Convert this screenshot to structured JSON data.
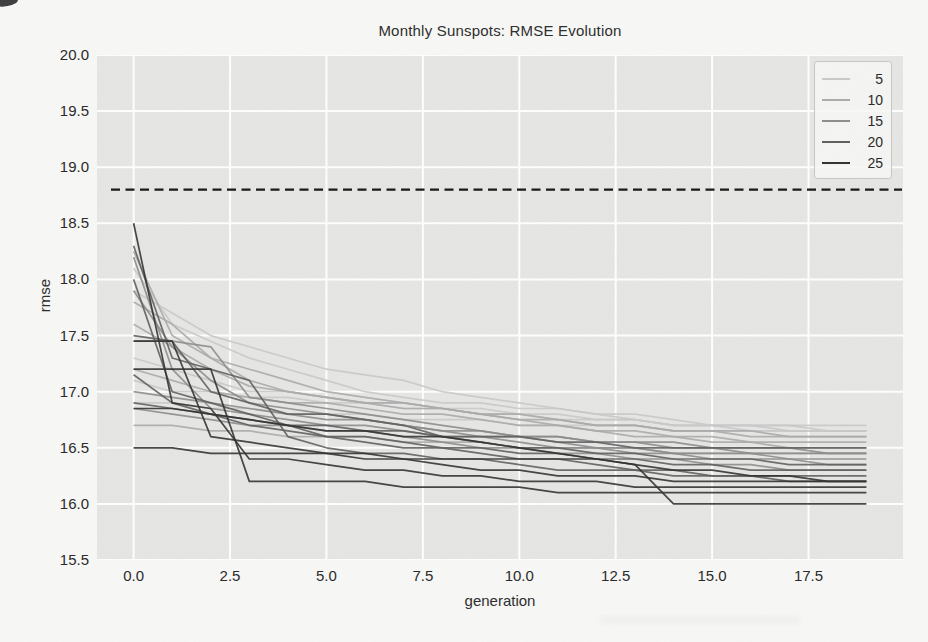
{
  "figure": {
    "background": "#f8f8f6",
    "plot_background": "#e6e6e4",
    "grid_color": "#ffffff"
  },
  "chart_data": {
    "type": "line",
    "title": "Monthly Sunspots: RMSE Evolution",
    "xlabel": "generation",
    "ylabel": "rmse",
    "xlim": [
      -0.95,
      19.95
    ],
    "ylim": [
      15.5,
      20.0
    ],
    "xticks": [
      0.0,
      2.5,
      5.0,
      7.5,
      10.0,
      12.5,
      15.0,
      17.5
    ],
    "xtick_labels": [
      "0.0",
      "2.5",
      "5.0",
      "7.5",
      "10.0",
      "12.5",
      "15.0",
      "17.5"
    ],
    "yticks": [
      15.5,
      16.0,
      16.5,
      17.0,
      17.5,
      18.0,
      18.5,
      19.0,
      19.5,
      20.0
    ],
    "ytick_labels": [
      "15.5",
      "16.0",
      "16.5",
      "17.0",
      "17.5",
      "18.0",
      "18.5",
      "19.0",
      "19.5",
      "20.0"
    ],
    "grid": true,
    "legend": {
      "position": "upper right",
      "entries": [
        {
          "label": "5",
          "color": "#c9c9c9"
        },
        {
          "label": "10",
          "color": "#ababab"
        },
        {
          "label": "15",
          "color": "#8c8c8c"
        },
        {
          "label": "20",
          "color": "#5e5e5e"
        },
        {
          "label": "25",
          "color": "#303030"
        }
      ]
    },
    "baseline": {
      "y": 18.8,
      "style": "dashed",
      "color": "#151515"
    },
    "x": [
      0,
      1,
      2,
      3,
      4,
      5,
      6,
      7,
      8,
      9,
      10,
      11,
      12,
      13,
      14,
      15,
      16,
      17,
      18,
      19
    ],
    "series": [
      {
        "group": "5",
        "color": "#c9c9c9",
        "values": [
          18.1,
          17.6,
          17.45,
          17.3,
          17.2,
          17.1,
          17.0,
          16.95,
          16.9,
          16.9,
          16.85,
          16.85,
          16.8,
          16.75,
          16.7,
          16.7,
          16.65,
          16.65,
          16.65,
          16.65
        ]
      },
      {
        "group": "5",
        "color": "#c9c9c9",
        "values": [
          17.9,
          17.7,
          17.5,
          17.4,
          17.3,
          17.2,
          17.15,
          17.1,
          17.0,
          16.95,
          16.9,
          16.85,
          16.8,
          16.8,
          16.75,
          16.7,
          16.7,
          16.7,
          16.65,
          16.65
        ]
      },
      {
        "group": "5",
        "color": "#c9c9c9",
        "values": [
          17.3,
          17.2,
          17.1,
          17.0,
          17.0,
          16.95,
          16.9,
          16.9,
          16.85,
          16.85,
          16.8,
          16.8,
          16.75,
          16.75,
          16.7,
          16.7,
          16.7,
          16.65,
          16.65,
          16.65
        ]
      },
      {
        "group": "5",
        "color": "#c9c9c9",
        "values": [
          16.9,
          16.9,
          16.85,
          16.85,
          16.8,
          16.8,
          16.8,
          16.75,
          16.75,
          16.75,
          16.7,
          16.7,
          16.7,
          16.7,
          16.65,
          16.65,
          16.65,
          16.65,
          16.65,
          16.65
        ]
      },
      {
        "group": "5",
        "color": "#c9c9c9",
        "values": [
          17.1,
          17.0,
          17.0,
          16.95,
          16.95,
          16.9,
          16.9,
          16.85,
          16.85,
          16.8,
          16.8,
          16.75,
          16.75,
          16.75,
          16.7,
          16.7,
          16.7,
          16.7,
          16.7,
          16.7
        ]
      },
      {
        "group": "10",
        "color": "#ababab",
        "values": [
          18.25,
          17.5,
          17.3,
          17.1,
          17.0,
          16.95,
          16.9,
          16.9,
          16.85,
          16.8,
          16.75,
          16.7,
          16.65,
          16.6,
          16.6,
          16.55,
          16.55,
          16.5,
          16.5,
          16.5
        ]
      },
      {
        "group": "10",
        "color": "#ababab",
        "values": [
          17.8,
          17.6,
          17.3,
          17.2,
          17.1,
          17.0,
          16.95,
          16.9,
          16.85,
          16.8,
          16.8,
          16.75,
          16.7,
          16.7,
          16.65,
          16.65,
          16.6,
          16.6,
          16.6,
          16.6
        ]
      },
      {
        "group": "10",
        "color": "#ababab",
        "values": [
          17.2,
          17.1,
          17.0,
          16.95,
          16.9,
          16.9,
          16.85,
          16.8,
          16.8,
          16.75,
          16.7,
          16.7,
          16.65,
          16.65,
          16.6,
          16.6,
          16.55,
          16.55,
          16.55,
          16.55
        ]
      },
      {
        "group": "10",
        "color": "#ababab",
        "values": [
          16.7,
          16.7,
          16.65,
          16.65,
          16.6,
          16.6,
          16.6,
          16.55,
          16.55,
          16.55,
          16.5,
          16.5,
          16.5,
          16.5,
          16.45,
          16.45,
          16.45,
          16.45,
          16.45,
          16.45
        ]
      },
      {
        "group": "10",
        "color": "#ababab",
        "values": [
          17.6,
          17.4,
          17.2,
          17.05,
          17.0,
          16.95,
          16.9,
          16.85,
          16.85,
          16.8,
          16.75,
          16.75,
          16.7,
          16.7,
          16.65,
          16.65,
          16.65,
          16.6,
          16.6,
          16.6
        ]
      },
      {
        "group": "15",
        "color": "#8c8c8c",
        "values": [
          17.9,
          17.4,
          17.1,
          16.9,
          16.85,
          16.8,
          16.75,
          16.7,
          16.65,
          16.6,
          16.6,
          16.55,
          16.5,
          16.5,
          16.45,
          16.45,
          16.45,
          16.4,
          16.4,
          16.4
        ]
      },
      {
        "group": "15",
        "color": "#8c8c8c",
        "values": [
          17.45,
          17.45,
          17.4,
          16.95,
          16.9,
          16.85,
          16.8,
          16.75,
          16.7,
          16.65,
          16.6,
          16.6,
          16.55,
          16.55,
          16.5,
          16.5,
          16.45,
          16.45,
          16.45,
          16.45
        ]
      },
      {
        "group": "15",
        "color": "#8c8c8c",
        "values": [
          16.85,
          16.8,
          16.75,
          16.7,
          16.7,
          16.65,
          16.65,
          16.6,
          16.55,
          16.5,
          16.5,
          16.45,
          16.45,
          16.4,
          16.4,
          16.35,
          16.35,
          16.3,
          16.3,
          16.3
        ]
      },
      {
        "group": "15",
        "color": "#8c8c8c",
        "values": [
          18.2,
          17.2,
          16.85,
          16.8,
          16.75,
          16.7,
          16.7,
          16.65,
          16.6,
          16.6,
          16.55,
          16.5,
          16.5,
          16.45,
          16.45,
          16.4,
          16.4,
          16.4,
          16.35,
          16.35
        ]
      },
      {
        "group": "15",
        "color": "#8c8c8c",
        "values": [
          17.0,
          16.95,
          16.9,
          16.85,
          16.8,
          16.75,
          16.75,
          16.7,
          16.65,
          16.65,
          16.6,
          16.6,
          16.55,
          16.55,
          16.55,
          16.5,
          16.5,
          16.5,
          16.45,
          16.45
        ]
      },
      {
        "group": "20",
        "color": "#5e5e5e",
        "values": [
          18.0,
          17.0,
          16.9,
          16.8,
          16.7,
          16.6,
          16.6,
          16.55,
          16.5,
          16.5,
          16.45,
          16.45,
          16.4,
          16.4,
          16.35,
          16.35,
          16.3,
          16.3,
          16.3,
          16.3
        ]
      },
      {
        "group": "20",
        "color": "#5e5e5e",
        "values": [
          17.5,
          17.45,
          17.0,
          16.9,
          16.8,
          16.8,
          16.75,
          16.7,
          16.6,
          16.55,
          16.5,
          16.5,
          16.45,
          16.45,
          16.4,
          16.4,
          16.4,
          16.35,
          16.35,
          16.35
        ]
      },
      {
        "group": "20",
        "color": "#5e5e5e",
        "values": [
          17.15,
          16.9,
          16.8,
          16.7,
          16.65,
          16.6,
          16.55,
          16.5,
          16.5,
          16.45,
          16.4,
          16.4,
          16.35,
          16.3,
          16.3,
          16.25,
          16.25,
          16.25,
          16.25,
          16.25
        ]
      },
      {
        "group": "20",
        "color": "#5e5e5e",
        "values": [
          16.9,
          16.85,
          16.8,
          16.75,
          16.7,
          16.7,
          16.65,
          16.65,
          16.6,
          16.6,
          16.6,
          16.55,
          16.55,
          16.5,
          16.5,
          16.5,
          16.5,
          16.5,
          16.5,
          16.5
        ]
      },
      {
        "group": "20",
        "color": "#5e5e5e",
        "values": [
          18.3,
          17.3,
          17.2,
          17.1,
          16.6,
          16.5,
          16.45,
          16.45,
          16.4,
          16.4,
          16.35,
          16.3,
          16.3,
          16.3,
          16.25,
          16.25,
          16.25,
          16.2,
          16.2,
          16.2
        ]
      },
      {
        "group": "25",
        "color": "#303030",
        "values": [
          18.5,
          16.9,
          16.85,
          16.4,
          16.4,
          16.35,
          16.3,
          16.3,
          16.25,
          16.25,
          16.2,
          16.2,
          16.2,
          16.15,
          16.15,
          16.15,
          16.15,
          16.15,
          16.15,
          16.15
        ]
      },
      {
        "group": "25",
        "color": "#303030",
        "values": [
          17.45,
          17.45,
          16.6,
          16.55,
          16.5,
          16.45,
          16.45,
          16.4,
          16.35,
          16.3,
          16.3,
          16.25,
          16.25,
          16.25,
          16.2,
          16.2,
          16.2,
          16.2,
          16.2,
          16.2
        ]
      },
      {
        "group": "25",
        "color": "#303030",
        "values": [
          17.2,
          17.2,
          17.2,
          16.2,
          16.2,
          16.2,
          16.2,
          16.15,
          16.15,
          16.15,
          16.15,
          16.1,
          16.1,
          16.1,
          16.1,
          16.1,
          16.1,
          16.1,
          16.1,
          16.1
        ]
      },
      {
        "group": "25",
        "color": "#303030",
        "values": [
          16.5,
          16.5,
          16.45,
          16.45,
          16.45,
          16.45,
          16.4,
          16.4,
          16.4,
          16.4,
          16.4,
          16.4,
          16.4,
          16.35,
          16.0,
          16.0,
          16.0,
          16.0,
          16.0,
          16.0
        ]
      },
      {
        "group": "25",
        "color": "#303030",
        "values": [
          16.85,
          16.85,
          16.8,
          16.75,
          16.7,
          16.65,
          16.65,
          16.6,
          16.6,
          16.55,
          16.5,
          16.45,
          16.4,
          16.35,
          16.3,
          16.3,
          16.25,
          16.25,
          16.2,
          16.2
        ]
      }
    ]
  }
}
